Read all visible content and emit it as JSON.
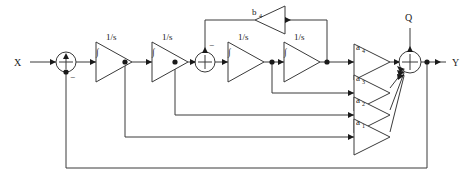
{
  "diagram": {
    "type": "block-diagram",
    "colors": {
      "wire": "#3a3a3a",
      "text": "#1a1a1a",
      "background": "#ffffff"
    },
    "io": {
      "input_label": "X",
      "output_label": "Y",
      "quantization_label": "Q"
    },
    "integrators": [
      {
        "id": "int1",
        "label": "1/s",
        "glyph": "∫"
      },
      {
        "id": "int2",
        "label": "1/s",
        "glyph": "∫"
      },
      {
        "id": "int3",
        "label": "1/s",
        "glyph": "∫"
      },
      {
        "id": "int4",
        "label": "1/s",
        "glyph": "∫"
      }
    ],
    "feedforward_gains": [
      {
        "id": "a4",
        "base": "a",
        "sub": "4"
      },
      {
        "id": "a3",
        "base": "a",
        "sub": "3"
      },
      {
        "id": "a2",
        "base": "a",
        "sub": "2"
      },
      {
        "id": "a1",
        "base": "a",
        "sub": "1"
      }
    ],
    "resonator_gain": {
      "id": "b4",
      "base": "b",
      "sub": "4"
    },
    "summers": [
      {
        "id": "sum1",
        "negative_sign": "−"
      },
      {
        "id": "sum2",
        "negative_sign": "−"
      },
      {
        "id": "sum-out",
        "negative_sign": ""
      }
    ]
  }
}
